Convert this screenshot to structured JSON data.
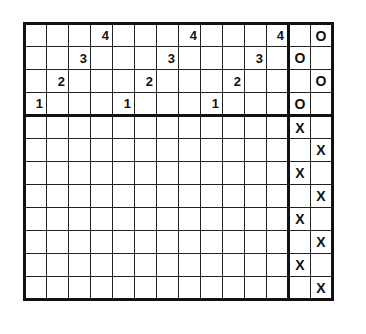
{
  "grid": {
    "rows": 12,
    "cols": 14,
    "main_cols": 12,
    "header_rows": 4,
    "cells": [
      [
        "",
        "",
        "",
        "4",
        "",
        "",
        "",
        "4",
        "",
        "",
        "",
        "4",
        "",
        "O"
      ],
      [
        "",
        "",
        "3",
        "",
        "",
        "",
        "3",
        "",
        "",
        "",
        "3",
        "",
        "O",
        ""
      ],
      [
        "",
        "2",
        "",
        "",
        "",
        "2",
        "",
        "",
        "",
        "2",
        "",
        "",
        "",
        "O"
      ],
      [
        "1",
        "",
        "",
        "",
        "1",
        "",
        "",
        "",
        "1",
        "",
        "",
        "",
        "O",
        ""
      ],
      [
        "",
        "",
        "",
        "",
        "",
        "",
        "",
        "",
        "",
        "",
        "",
        "",
        "X",
        ""
      ],
      [
        "",
        "",
        "",
        "",
        "",
        "",
        "",
        "",
        "",
        "",
        "",
        "",
        "",
        "X"
      ],
      [
        "",
        "",
        "",
        "",
        "",
        "",
        "",
        "",
        "",
        "",
        "",
        "",
        "X",
        ""
      ],
      [
        "",
        "",
        "",
        "",
        "",
        "",
        "",
        "",
        "",
        "",
        "",
        "",
        "",
        "X"
      ],
      [
        "",
        "",
        "",
        "",
        "",
        "",
        "",
        "",
        "",
        "",
        "",
        "",
        "X",
        ""
      ],
      [
        "",
        "",
        "",
        "",
        "",
        "",
        "",
        "",
        "",
        "",
        "",
        "",
        "",
        "X"
      ],
      [
        "",
        "",
        "",
        "",
        "",
        "",
        "",
        "",
        "",
        "",
        "",
        "",
        "X",
        ""
      ],
      [
        "",
        "",
        "",
        "",
        "",
        "",
        "",
        "",
        "",
        "",
        "",
        "",
        "",
        "X"
      ]
    ]
  }
}
